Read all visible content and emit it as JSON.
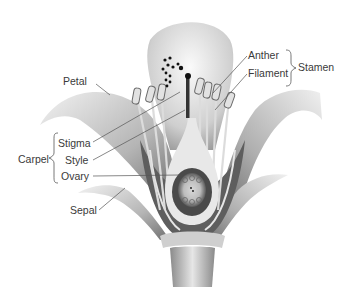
{
  "diagram": {
    "labels": {
      "petal": "Petal",
      "stigma": "Stigma",
      "style": "Style",
      "ovary": "Ovary",
      "sepal": "Sepal",
      "anther": "Anther",
      "filament": "Filament"
    },
    "groups": {
      "carpel": "Carpel",
      "stamen": "Stamen"
    },
    "colors": {
      "label_text": "#3a3a3a",
      "leader_line": "#555555",
      "petal_light": "#e8e8e8",
      "petal_dark": "#7a7a7a",
      "pollen": "#111111"
    }
  }
}
